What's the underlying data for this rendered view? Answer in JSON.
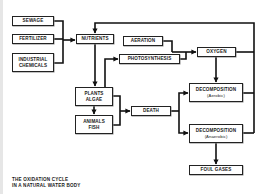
{
  "diagram": {
    "title_lines": [
      "THE OXIDATION CYCLE",
      "IN A NATURAL WATER BODY"
    ],
    "nodes": {
      "sewage": {
        "label": "SEWAGE"
      },
      "fertilizer": {
        "label": "FERTILIZER"
      },
      "industrial": {
        "line1": "INDUSTRIAL",
        "line2": "CHEMICALS"
      },
      "nutrients": {
        "label": "NUTRIENTS"
      },
      "aeration": {
        "label": "AERATION"
      },
      "photosynthesis": {
        "label": "PHOTOSYNTHESIS"
      },
      "oxygen": {
        "label": "OXYGEN"
      },
      "plants": {
        "line1": "PLANTS",
        "line2": "ALGAE"
      },
      "animals": {
        "line1": "ANIMALS",
        "line2": "FISH"
      },
      "death": {
        "label": "DEATH"
      },
      "decomp_aerobic": {
        "line1": "DECOMPOSITION",
        "line2": "(Aerobic)"
      },
      "decomp_anaerobic": {
        "line1": "DECOMPOSITION",
        "line2": "(Anaerobic)"
      },
      "foul_gases": {
        "label": "FOUL GASES"
      }
    },
    "edges": [
      {
        "from": "sewage",
        "to": "nutrients"
      },
      {
        "from": "fertilizer",
        "to": "nutrients"
      },
      {
        "from": "industrial",
        "to": "nutrients"
      },
      {
        "from": "nutrients",
        "to": "plants"
      },
      {
        "from": "plants",
        "to": "photosynthesis"
      },
      {
        "from": "aeration",
        "to": "oxygen"
      },
      {
        "from": "photosynthesis",
        "to": "oxygen"
      },
      {
        "from": "oxygen",
        "to": "decomp_aerobic"
      },
      {
        "from": "plants",
        "to": "animals"
      },
      {
        "from": "plants",
        "to": "death"
      },
      {
        "from": "animals",
        "to": "death"
      },
      {
        "from": "death",
        "to": "decomp_aerobic"
      },
      {
        "from": "death",
        "to": "decomp_anaerobic"
      },
      {
        "from": "decomp_anaerobic",
        "to": "foul_gases"
      },
      {
        "from": "oxygen",
        "to": "nutrients"
      },
      {
        "from": "decomp_aerobic",
        "to": "nutrients"
      },
      {
        "from": "decomp_anaerobic",
        "to": "nutrients"
      }
    ]
  }
}
